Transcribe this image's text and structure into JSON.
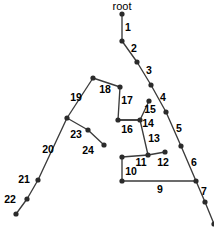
{
  "figure": {
    "title": "root",
    "background_color": "#ffffff",
    "node_color": "#2b2b2b",
    "edge_color": "#3b3b3b",
    "label_color": "#000000",
    "width": 214,
    "height": 228
  },
  "root": {
    "label": "root",
    "label_x": 122,
    "label_y": 7,
    "node_x": 122,
    "node_y": 14
  },
  "chart_data": {
    "type": "diagram",
    "diagram_type": "tree-graph",
    "title": "root",
    "nodes": [
      {
        "id": "n0",
        "x": 122,
        "y": 14
      },
      {
        "id": "n1",
        "x": 122,
        "y": 41
      },
      {
        "id": "n2",
        "x": 137,
        "y": 62
      },
      {
        "id": "n3",
        "x": 151,
        "y": 85
      },
      {
        "id": "n4",
        "x": 166,
        "y": 112
      },
      {
        "id": "n5",
        "x": 181,
        "y": 146
      },
      {
        "id": "n6",
        "x": 196,
        "y": 181
      },
      {
        "id": "n7",
        "x": 205,
        "y": 202
      },
      {
        "id": "n8",
        "x": 214,
        "y": 224
      },
      {
        "id": "n9",
        "x": 122,
        "y": 181
      },
      {
        "id": "n10",
        "x": 122,
        "y": 157
      },
      {
        "id": "n11",
        "x": 148,
        "y": 155
      },
      {
        "id": "n12",
        "x": 165,
        "y": 152
      },
      {
        "id": "n13",
        "x": 140,
        "y": 120
      },
      {
        "id": "n15",
        "x": 149,
        "y": 101
      },
      {
        "id": "n16",
        "x": 118,
        "y": 120
      },
      {
        "id": "n17",
        "x": 120,
        "y": 87
      },
      {
        "id": "n18",
        "x": 93,
        "y": 78
      },
      {
        "id": "n19",
        "x": 67,
        "y": 118
      },
      {
        "id": "n21",
        "x": 38,
        "y": 180
      },
      {
        "id": "n22",
        "x": 27,
        "y": 199
      },
      {
        "id": "n23",
        "x": 16,
        "y": 214
      },
      {
        "id": "n24",
        "x": 88,
        "y": 130
      },
      {
        "id": "n25",
        "x": 104,
        "y": 145
      }
    ],
    "edges": [
      {
        "label": "1",
        "from": "n0",
        "to": "n1",
        "label_x": 128,
        "label_y": 28
      },
      {
        "label": "2",
        "from": "n1",
        "to": "n2",
        "label_x": 134,
        "label_y": 49
      },
      {
        "label": "3",
        "from": "n2",
        "to": "n3",
        "label_x": 149,
        "label_y": 71
      },
      {
        "label": "4",
        "from": "n3",
        "to": "n4",
        "label_x": 163,
        "label_y": 98
      },
      {
        "label": "5",
        "from": "n4",
        "to": "n5",
        "label_x": 179,
        "label_y": 129
      },
      {
        "label": "6",
        "from": "n5",
        "to": "n6",
        "label_x": 194,
        "label_y": 163
      },
      {
        "label": "7",
        "from": "n6",
        "to": "n7",
        "label_x": 204,
        "label_y": 192
      },
      {
        "label": "9",
        "from": "n9",
        "to": "n6",
        "label_x": 160,
        "label_y": 190
      },
      {
        "label": "10",
        "from": "n10",
        "to": "n9",
        "label_x": 131,
        "label_y": 172
      },
      {
        "label": "11",
        "from": "n10",
        "to": "n11",
        "label_x": 141,
        "label_y": 163
      },
      {
        "label": "12",
        "from": "n11",
        "to": "n12",
        "label_x": 163,
        "label_y": 163
      },
      {
        "label": "13",
        "from": "n13",
        "to": "n11",
        "label_x": 154,
        "label_y": 139
      },
      {
        "label": "14",
        "from": "n16",
        "to": "n13",
        "label_x": 148,
        "label_y": 124
      },
      {
        "label": "15",
        "from": "n13",
        "to": "n15",
        "label_x": 150,
        "label_y": 110
      },
      {
        "label": "16",
        "from": "n16",
        "to": "n13",
        "label_x": 127,
        "label_y": 130
      },
      {
        "label": "17",
        "from": "n17",
        "to": "n16",
        "label_x": 127,
        "label_y": 101
      },
      {
        "label": "18",
        "from": "n18",
        "to": "n17",
        "label_x": 105,
        "label_y": 90
      },
      {
        "label": "19",
        "from": "n19",
        "to": "n18",
        "label_x": 76,
        "label_y": 98
      },
      {
        "label": "20",
        "from": "n19",
        "to": "n21",
        "label_x": 48,
        "label_y": 150
      },
      {
        "label": "21",
        "from": "n21",
        "to": "n22",
        "label_x": 24,
        "label_y": 180
      },
      {
        "label": "22",
        "from": "n22",
        "to": "n23",
        "label_x": 10,
        "label_y": 200
      },
      {
        "label": "23",
        "from": "n19",
        "to": "n24",
        "label_x": 76,
        "label_y": 135
      },
      {
        "label": "24",
        "from": "n24",
        "to": "n25",
        "label_x": 88,
        "label_y": 151
      }
    ],
    "extra_segments": [
      {
        "from": "n7",
        "to": "n8"
      }
    ],
    "node_radius": 2.6,
    "xlabel": "",
    "ylabel": "",
    "grid": false,
    "legend": null
  }
}
